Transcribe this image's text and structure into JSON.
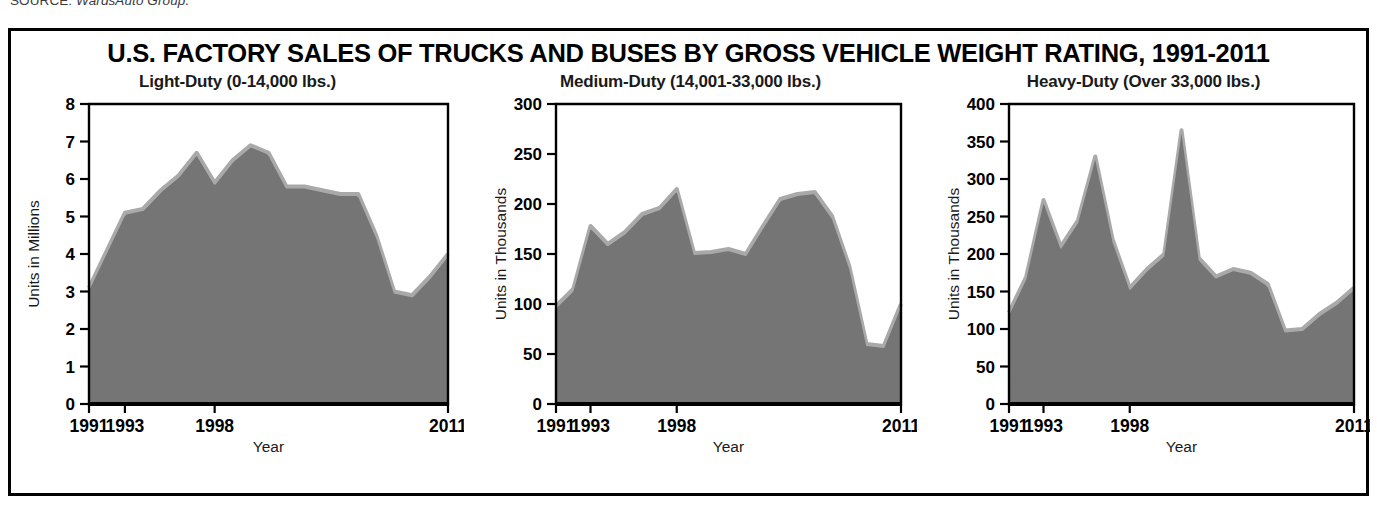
{
  "source_caption": {
    "label": "SOURCE:",
    "name": "WardsAuto Group."
  },
  "figure": {
    "title": "U.S. FACTORY SALES OF TRUCKS AND BUSES BY GROSS VEHICLE WEIGHT RATING, 1991-2011",
    "border_color": "#000000",
    "fill_color": "#757575",
    "highlight_color": "#a9a9a9",
    "background": "#ffffff"
  },
  "chart_data": [
    {
      "type": "area",
      "panel_index": 0,
      "title": "Light-Duty (0-14,000 lbs.)",
      "xlabel": "Year",
      "ylabel": "Units in Millions",
      "ylim": [
        0,
        8
      ],
      "yticks": [
        0,
        1,
        2,
        3,
        4,
        5,
        6,
        7,
        8
      ],
      "ytick_labels": [
        "0",
        "1",
        "2",
        "3",
        "4",
        "5",
        "6",
        "7",
        "8"
      ],
      "xtick_positions": [
        1991,
        1993,
        1998,
        2011
      ],
      "xtick_labels": [
        "1991",
        "1993",
        "1998",
        "2011"
      ],
      "grid": false,
      "legend": "none",
      "x": [
        1991,
        1992,
        1993,
        1994,
        1995,
        1996,
        1997,
        1998,
        1999,
        2000,
        2001,
        2002,
        2003,
        2004,
        2005,
        2006,
        2007,
        2008,
        2009,
        2010,
        2011
      ],
      "values": [
        3.1,
        4.1,
        5.1,
        5.2,
        5.7,
        6.1,
        6.7,
        5.9,
        6.5,
        6.9,
        6.7,
        5.8,
        5.8,
        5.7,
        5.6,
        5.6,
        4.5,
        3.0,
        2.9,
        3.4,
        4.0
      ]
    },
    {
      "type": "area",
      "panel_index": 1,
      "title": "Medium-Duty (14,001-33,000 lbs.)",
      "xlabel": "Year",
      "ylabel": "Units in Thousands",
      "ylim": [
        0,
        300
      ],
      "yticks": [
        0,
        50,
        100,
        150,
        200,
        250,
        300
      ],
      "ytick_labels": [
        "0",
        "50",
        "100",
        "150",
        "200",
        "250",
        "300"
      ],
      "xtick_positions": [
        1991,
        1993,
        1998,
        2011
      ],
      "xtick_labels": [
        "1991",
        "1993",
        "1998",
        "2011"
      ],
      "grid": false,
      "legend": "none",
      "x": [
        1991,
        1992,
        1993,
        1994,
        1995,
        1996,
        1997,
        1998,
        1999,
        2000,
        2001,
        2002,
        2003,
        2004,
        2005,
        2006,
        2007,
        2008,
        2009,
        2010,
        2011
      ],
      "values": [
        98,
        115,
        178,
        160,
        172,
        190,
        196,
        215,
        151,
        152,
        155,
        150,
        178,
        205,
        210,
        212,
        188,
        138,
        60,
        58,
        100
      ]
    },
    {
      "type": "area",
      "panel_index": 2,
      "title": "Heavy-Duty (Over 33,000 lbs.)",
      "xlabel": "Year",
      "ylabel": "Units in Thousands",
      "ylim": [
        0,
        400
      ],
      "yticks": [
        0,
        50,
        100,
        150,
        200,
        250,
        300,
        350,
        400
      ],
      "ytick_labels": [
        "0",
        "50",
        "100",
        "150",
        "200",
        "250",
        "300",
        "350",
        "400"
      ],
      "xtick_positions": [
        1991,
        1993,
        1998,
        2011
      ],
      "xtick_labels": [
        "1991",
        "1993",
        "1998",
        "2011"
      ],
      "grid": false,
      "legend": "none",
      "x": [
        1991,
        1992,
        1993,
        1994,
        1995,
        1996,
        1997,
        1998,
        1999,
        2000,
        2001,
        2002,
        2003,
        2004,
        2005,
        2006,
        2007,
        2008,
        2009,
        2010,
        2011
      ],
      "values": [
        122,
        170,
        272,
        210,
        245,
        330,
        220,
        155,
        180,
        200,
        365,
        195,
        170,
        180,
        175,
        160,
        98,
        100,
        120,
        135,
        155
      ]
    }
  ]
}
